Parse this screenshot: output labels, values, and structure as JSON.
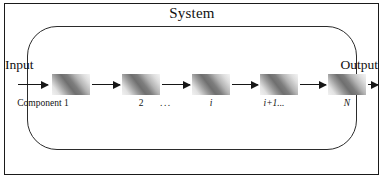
{
  "figure": {
    "system_title": "System",
    "input_label": "Input",
    "output_label": "Output",
    "ellipsis": "...",
    "components": [
      {
        "label": "Component 1",
        "italic": false
      },
      {
        "label": "2",
        "italic": false
      },
      {
        "label": "i",
        "italic": true
      },
      {
        "label": "i+1...",
        "italic": true
      },
      {
        "label": "N",
        "italic": true
      }
    ],
    "colors": {
      "frame": "#1a1a1a",
      "boundary": "#2b2b2b",
      "arrow": "#161616",
      "text": "#111111",
      "box_gradient_light": "#f4f4f4",
      "box_gradient_dark": "#6f6f6f",
      "background": "#ffffff"
    }
  }
}
